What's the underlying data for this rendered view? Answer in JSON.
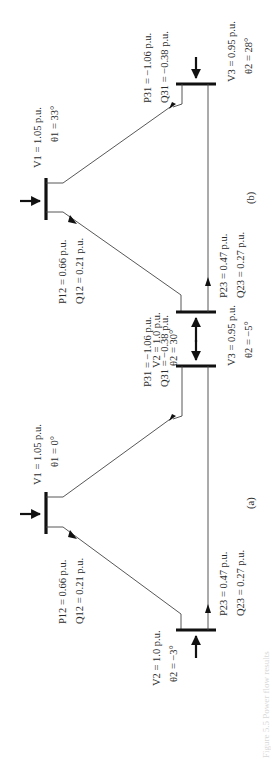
{
  "figure": {
    "caption_fragment": "Figure 5.5 Power flow results",
    "diagrams": [
      {
        "id": "b",
        "label": "(b)",
        "bus1": {
          "v": "V1 = 1.05 p.u.",
          "theta": "θ1 = 33°"
        },
        "bus2": {
          "v": "V2 = 1.0 p.u.",
          "theta": "θ2 = 30°"
        },
        "bus3": {
          "v": "V3 = 0.95 p.u.",
          "theta": "θ2 = 28°"
        },
        "flow12": {
          "p": "P12 = 0.66 p.u.",
          "q": "Q12 = 0.21 p.u."
        },
        "flow23": {
          "p": "P23 = 0.47 p.u.",
          "q": "Q23 = 0.27 p.u."
        },
        "flow31": {
          "p": "P31 = −1.06 p.u.",
          "q": "Q31 = −0.38 p.u."
        }
      },
      {
        "id": "a",
        "label": "(a)",
        "bus1": {
          "v": "V1 = 1.05 p.u.",
          "theta": "θ1 = 0°"
        },
        "bus2": {
          "v": "V2 = 1.0 p.u.",
          "theta": "θ2 = −3°"
        },
        "bus3": {
          "v": "V3 = 0.95 p.u.",
          "theta": "θ2 = −5°"
        },
        "flow12": {
          "p": "P12 = 0.66 p.u.",
          "q": "Q12 = 0.21 p.u."
        },
        "flow23": {
          "p": "P23 = 0.47 p.u.",
          "q": "Q23 = 0.27 p.u."
        },
        "flow31": {
          "p": "P31 = −1.06 p.u.",
          "q": "Q31 = −0.38 p.u."
        }
      }
    ]
  }
}
